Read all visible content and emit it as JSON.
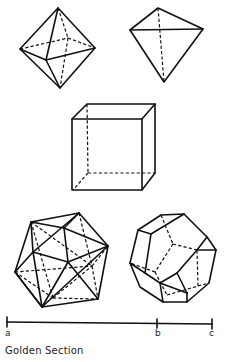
{
  "figure": {
    "solids": [
      {
        "name": "octahedron"
      },
      {
        "name": "tetrahedron"
      },
      {
        "name": "cube"
      },
      {
        "name": "icosahedron"
      },
      {
        "name": "dodecahedron"
      }
    ],
    "segment": {
      "labels": {
        "a": "a",
        "b": "b",
        "c": "c"
      }
    },
    "caption": "Golden Section"
  }
}
